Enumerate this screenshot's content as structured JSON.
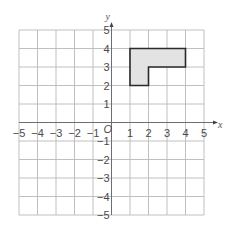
{
  "figure": {
    "type": "coordinate-plane",
    "x_axis": {
      "label": "x",
      "min": -5,
      "max": 5,
      "tick_labels": [
        "-5",
        "-4",
        "-3",
        "-2",
        "-1",
        "1",
        "2",
        "3",
        "4",
        "5"
      ]
    },
    "y_axis": {
      "label": "y",
      "min": -5,
      "max": 5,
      "tick_labels": [
        "5",
        "4",
        "3",
        "2",
        "1",
        "-1",
        "-2",
        "-3",
        "-4",
        "-5"
      ]
    },
    "origin_label": "O",
    "shape": {
      "name": "L-shaped polygon",
      "vertices": [
        [
          1,
          2
        ],
        [
          1,
          4
        ],
        [
          4,
          4
        ],
        [
          4,
          3
        ],
        [
          2,
          3
        ],
        [
          2,
          2
        ]
      ],
      "fill": "#e3e3e3",
      "stroke": "#2a2a2a"
    },
    "colors": {
      "grid": "#b9b9b9",
      "axis": "#6e6e6e",
      "text": "#4a4a4a"
    }
  }
}
